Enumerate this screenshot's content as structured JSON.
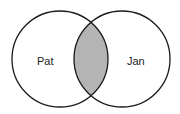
{
  "diagram": {
    "type": "venn",
    "sets": [
      {
        "label": "Pat",
        "cx": 60,
        "cy": 59,
        "r": 48
      },
      {
        "label": "Jan",
        "cx": 122,
        "cy": 59,
        "r": 48
      }
    ],
    "intersection_fill": "#b4b4b4",
    "stroke": "#1a1a1a"
  }
}
